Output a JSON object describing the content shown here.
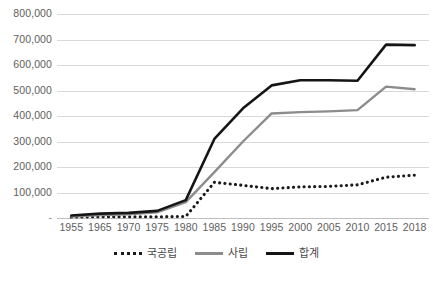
{
  "chart_data": {
    "type": "line",
    "title": "",
    "subtitle": "",
    "xlabel": "",
    "ylabel": "",
    "categories": [
      "1955",
      "1965",
      "1970",
      "1975",
      "1980",
      "1985",
      "1990",
      "1995",
      "2000",
      "2005",
      "2010",
      "2015",
      "2018"
    ],
    "ylim": [
      0,
      800000
    ],
    "y_ticks": [
      0,
      100000,
      200000,
      300000,
      400000,
      500000,
      600000,
      700000,
      800000
    ],
    "y_tick_labels": [
      "-",
      "100,000",
      "200,000",
      "300,000",
      "400,000",
      "500,000",
      "600,000",
      "700,000",
      "800,000"
    ],
    "grid": true,
    "legend_position": "bottom",
    "series": [
      {
        "name": "국공립",
        "style": "dotted",
        "color": "#1a1a1a",
        "values": [
          4000,
          5000,
          5000,
          5000,
          6000,
          140000,
          128000,
          115000,
          122000,
          124000,
          130000,
          160000,
          168000
        ]
      },
      {
        "name": "사립",
        "style": "solid",
        "color": "#8c8c8c",
        "values": [
          6000,
          12000,
          15000,
          22000,
          62000,
          180000,
          300000,
          410000,
          415000,
          418000,
          423000,
          515000,
          505000
        ]
      },
      {
        "name": "합계",
        "style": "solid",
        "color": "#151515",
        "values": [
          10000,
          17000,
          20000,
          28000,
          70000,
          310000,
          430000,
          520000,
          540000,
          540000,
          538000,
          680000,
          678000
        ]
      }
    ]
  },
  "legend": {
    "items": [
      {
        "label": "국공립",
        "style": "dotted"
      },
      {
        "label": "사립",
        "style": "solid-gray"
      },
      {
        "label": "합계",
        "style": "solid-black"
      }
    ]
  },
  "colors": {
    "gridline": "#d9d9d9",
    "baseline": "#bfbfbf",
    "axis_text": "#5e5e5e",
    "background": "#ffffff"
  }
}
